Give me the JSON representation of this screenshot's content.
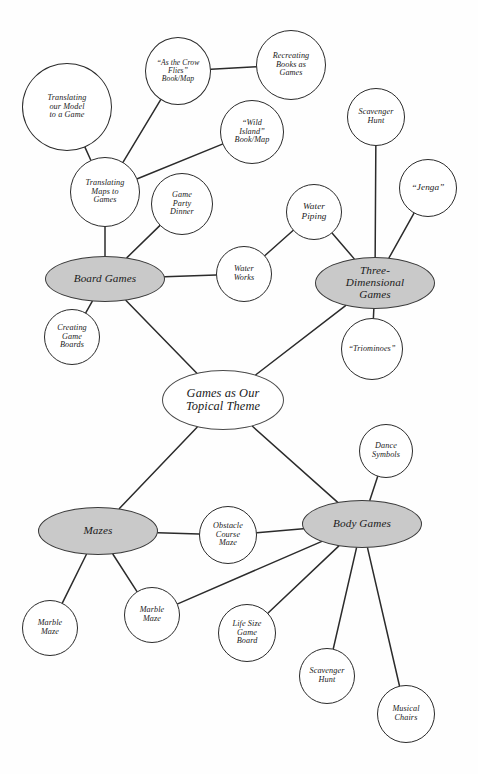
{
  "diagram": {
    "title": "Games as Our Topical Theme",
    "type": "concept-map",
    "background_color": "#fefefe",
    "shaded_fill": "#c9c9c9",
    "node_fill": "#ffffff",
    "stroke_color": "#2b2b2b"
  },
  "nodes": [
    {
      "id": "translating-our-model",
      "label": "Translating\nour Model\nto a Game",
      "shape": "circle",
      "shaded": false,
      "cx": 67,
      "cy": 107,
      "rx": 45,
      "ry": 44,
      "size": "sz-small"
    },
    {
      "id": "as-the-crow-flies",
      "label": "“As the Crow\nFlies”\nBook/Map",
      "shape": "circle",
      "shaded": false,
      "cx": 178,
      "cy": 71,
      "rx": 33,
      "ry": 34,
      "size": "sz-tiny"
    },
    {
      "id": "recreating-books-as-games",
      "label": "Recreating\nBooks as\nGames",
      "shape": "circle",
      "shaded": false,
      "cx": 291,
      "cy": 65,
      "rx": 35,
      "ry": 35,
      "size": "sz-small"
    },
    {
      "id": "wild-island",
      "label": "“Wild\nIsland”\nBook/Map",
      "shape": "circle",
      "shaded": false,
      "cx": 252,
      "cy": 132,
      "rx": 32,
      "ry": 32,
      "size": "sz-small"
    },
    {
      "id": "scavenger-hunt-top",
      "label": "Scavenger\nHunt",
      "shape": "circle",
      "shaded": false,
      "cx": 376,
      "cy": 117,
      "rx": 29,
      "ry": 29,
      "size": "sz-small"
    },
    {
      "id": "jenga",
      "label": "“Jenga”",
      "shape": "circle",
      "shaded": false,
      "cx": 428,
      "cy": 188,
      "rx": 29,
      "ry": 29,
      "size": "sz-mid"
    },
    {
      "id": "translating-maps-to-games",
      "label": "Translating\nMaps to\nGames",
      "shape": "circle",
      "shaded": false,
      "cx": 105,
      "cy": 192,
      "rx": 35,
      "ry": 35,
      "size": "sz-small"
    },
    {
      "id": "game-party-dinner",
      "label": "Game\nParty\nDinner",
      "shape": "circle",
      "shaded": false,
      "cx": 182,
      "cy": 204,
      "rx": 31,
      "ry": 31,
      "size": "sz-small"
    },
    {
      "id": "water-piping",
      "label": "Water\nPiping",
      "shape": "circle",
      "shaded": false,
      "cx": 314,
      "cy": 212,
      "rx": 28,
      "ry": 28,
      "size": "sz-mid"
    },
    {
      "id": "board-games",
      "label": "Board Games",
      "shape": "ellipse",
      "shaded": true,
      "cx": 105,
      "cy": 279,
      "rx": 60,
      "ry": 23,
      "size": "sz-hub"
    },
    {
      "id": "water-works",
      "label": "Water\nWorks",
      "shape": "circle",
      "shaded": false,
      "cx": 244,
      "cy": 274,
      "rx": 28,
      "ry": 28,
      "size": "sz-small"
    },
    {
      "id": "three-dimensional-games",
      "label": "Three-\nDimensional\nGames",
      "shape": "ellipse",
      "shaded": true,
      "cx": 375,
      "cy": 283,
      "rx": 60,
      "ry": 26,
      "size": "sz-hub"
    },
    {
      "id": "creating-game-boards",
      "label": "Creating\nGame\nBoards",
      "shape": "circle",
      "shaded": false,
      "cx": 72,
      "cy": 337,
      "rx": 28,
      "ry": 28,
      "size": "sz-small"
    },
    {
      "id": "triominoes",
      "label": "“Triominoes”",
      "shape": "circle",
      "shaded": false,
      "cx": 372,
      "cy": 349,
      "rx": 31,
      "ry": 31,
      "size": "sz-small"
    },
    {
      "id": "games-as-our-topical-theme",
      "label": "Games as Our\nTopical Theme",
      "shape": "ellipse",
      "shaded": false,
      "central": true,
      "cx": 223,
      "cy": 400,
      "rx": 61,
      "ry": 30,
      "size": "sz-core"
    },
    {
      "id": "dance-symbols",
      "label": "Dance\nSymbols",
      "shape": "circle",
      "shaded": false,
      "cx": 386,
      "cy": 451,
      "rx": 27,
      "ry": 27,
      "size": "sz-small"
    },
    {
      "id": "mazes",
      "label": "Mazes",
      "shape": "ellipse",
      "shaded": true,
      "cx": 98,
      "cy": 531,
      "rx": 60,
      "ry": 24,
      "size": "sz-hub"
    },
    {
      "id": "obstacle-course-maze",
      "label": "Obstacle\nCourse\nMaze",
      "shape": "circle",
      "shaded": false,
      "cx": 228,
      "cy": 535,
      "rx": 29,
      "ry": 29,
      "size": "sz-small"
    },
    {
      "id": "body-games",
      "label": "Body Games",
      "shape": "ellipse",
      "shaded": true,
      "cx": 362,
      "cy": 524,
      "rx": 60,
      "ry": 24,
      "size": "sz-hub"
    },
    {
      "id": "marble-maze-left",
      "label": "Marble\nMaze",
      "shape": "circle",
      "shaded": false,
      "cx": 50,
      "cy": 628,
      "rx": 28,
      "ry": 28,
      "size": "sz-small"
    },
    {
      "id": "marble-maze-mid",
      "label": "Marble\nMaze",
      "shape": "circle",
      "shaded": false,
      "cx": 152,
      "cy": 615,
      "rx": 28,
      "ry": 28,
      "size": "sz-small"
    },
    {
      "id": "life-size-game-board",
      "label": "Life Size\nGame\nBoard",
      "shape": "circle",
      "shaded": false,
      "cx": 247,
      "cy": 633,
      "rx": 29,
      "ry": 29,
      "size": "sz-small"
    },
    {
      "id": "scavenger-hunt-bottom",
      "label": "Scavenger\nHunt",
      "shape": "circle",
      "shaded": false,
      "cx": 327,
      "cy": 676,
      "rx": 28,
      "ry": 28,
      "size": "sz-small"
    },
    {
      "id": "musical-chairs",
      "label": "Musical\nChairs",
      "shape": "circle",
      "shaded": false,
      "cx": 406,
      "cy": 714,
      "rx": 29,
      "ry": 29,
      "size": "sz-small"
    }
  ],
  "edges": [
    {
      "from": "translating-our-model",
      "to": "translating-maps-to-games"
    },
    {
      "from": "as-the-crow-flies",
      "to": "recreating-books-as-games"
    },
    {
      "from": "as-the-crow-flies",
      "to": "translating-maps-to-games"
    },
    {
      "from": "wild-island",
      "to": "translating-maps-to-games"
    },
    {
      "from": "translating-maps-to-games",
      "to": "board-games"
    },
    {
      "from": "game-party-dinner",
      "to": "board-games"
    },
    {
      "from": "board-games",
      "to": "water-works"
    },
    {
      "from": "water-works",
      "to": "water-piping"
    },
    {
      "from": "water-piping",
      "to": "three-dimensional-games"
    },
    {
      "from": "scavenger-hunt-top",
      "to": "three-dimensional-games"
    },
    {
      "from": "jenga",
      "to": "three-dimensional-games"
    },
    {
      "from": "three-dimensional-games",
      "to": "triominoes"
    },
    {
      "from": "board-games",
      "to": "creating-game-boards"
    },
    {
      "from": "board-games",
      "to": "games-as-our-topical-theme"
    },
    {
      "from": "three-dimensional-games",
      "to": "games-as-our-topical-theme"
    },
    {
      "from": "games-as-our-topical-theme",
      "to": "mazes"
    },
    {
      "from": "games-as-our-topical-theme",
      "to": "body-games"
    },
    {
      "from": "mazes",
      "to": "obstacle-course-maze"
    },
    {
      "from": "obstacle-course-maze",
      "to": "body-games"
    },
    {
      "from": "dance-symbols",
      "to": "body-games"
    },
    {
      "from": "mazes",
      "to": "marble-maze-left"
    },
    {
      "from": "mazes",
      "to": "marble-maze-mid"
    },
    {
      "from": "marble-maze-mid",
      "to": "body-games"
    },
    {
      "from": "life-size-game-board",
      "to": "body-games"
    },
    {
      "from": "scavenger-hunt-bottom",
      "to": "body-games"
    },
    {
      "from": "musical-chairs",
      "to": "body-games"
    }
  ]
}
